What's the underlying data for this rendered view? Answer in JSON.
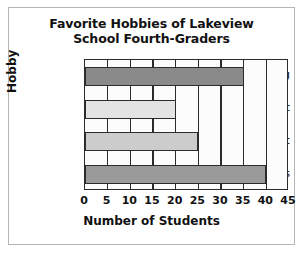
{
  "chart_data": {
    "type": "bar",
    "orientation": "horizontal",
    "title": "Favorite Hobbies of Lakeview School Fourth-Graders",
    "title_line1": "Favorite Hobbies of Lakeview",
    "title_line2": "School Fourth-Graders",
    "xlabel": "Number of Students",
    "ylabel": "Hobby",
    "categories": [
      "Reading",
      "Art",
      "Music",
      "Sports"
    ],
    "values": [
      35,
      20,
      25,
      40
    ],
    "bar_colors": [
      "#8a8a8a",
      "#e3e3e3",
      "#cccccc",
      "#9a9a9a"
    ],
    "xlim": [
      0,
      45
    ],
    "xticks": [
      0,
      5,
      10,
      15,
      20,
      25,
      30,
      35,
      40,
      45
    ],
    "xtick_labels": [
      "0",
      "5",
      "10",
      "15",
      "20",
      "25",
      "30",
      "35",
      "40",
      "45"
    ],
    "grid": "vertical",
    "legend": null,
    "bar_edge_color": "#2b2b2b",
    "axes_color": "#2b2b2b",
    "plot_background": "#fcfcfc",
    "frame_color": "#b6b6b6"
  }
}
